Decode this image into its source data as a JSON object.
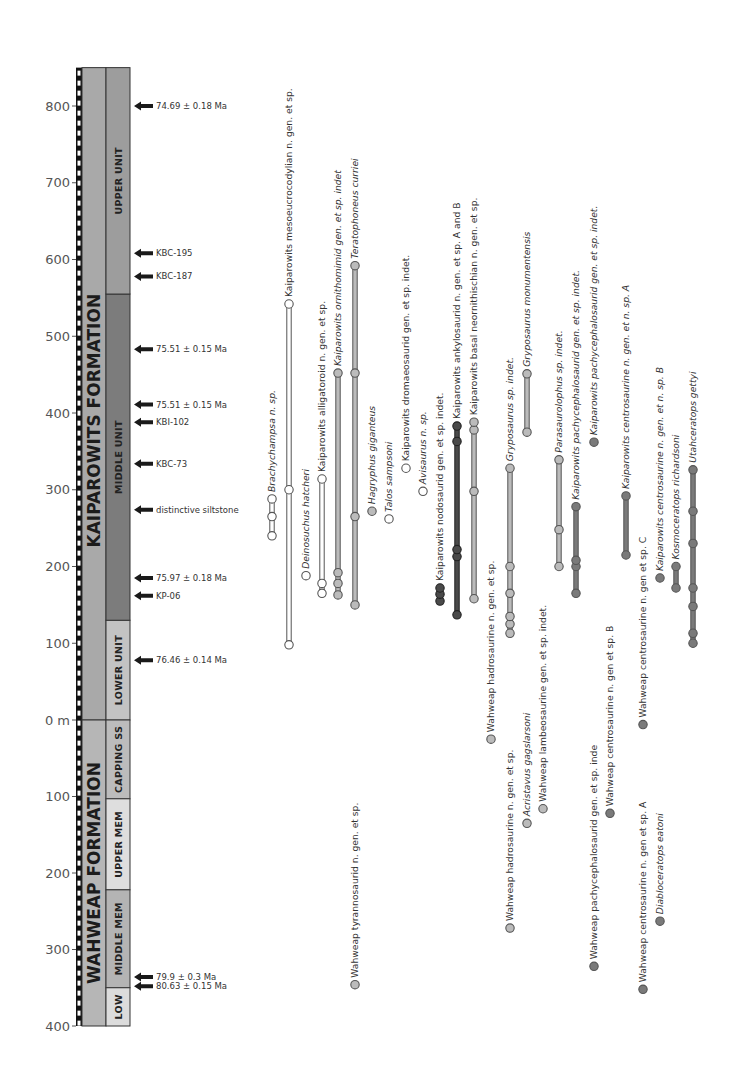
{
  "chart_data": {
    "type": "range-chart",
    "title": "",
    "ylabel": "Stratigraphic height (m)",
    "grid": false,
    "axis": {
      "kaiparowits_ticks": [
        "800",
        "700",
        "600",
        "500",
        "400",
        "300",
        "200",
        "100"
      ],
      "zero_label": "0 m",
      "wahweap_ticks": [
        "100",
        "200",
        "300",
        "400"
      ],
      "kaiparowits_range": [
        0,
        850
      ],
      "wahweap_range": [
        0,
        400
      ]
    },
    "formations": [
      {
        "name": "KAIPAROWITS FORMATION",
        "base": 0,
        "top": 850,
        "color": "#a9a9a9",
        "units": [
          {
            "name": "LOWER UNIT",
            "from": 0,
            "to": 130,
            "color": "#c3c3c3"
          },
          {
            "name": "MIDDLE UNIT",
            "from": 130,
            "to": 555,
            "color": "#7c7c7c"
          },
          {
            "name": "UPPER UNIT",
            "from": 555,
            "to": 850,
            "color": "#9d9d9d"
          }
        ]
      },
      {
        "name": "WAHWEAP FORMATION",
        "base": 400,
        "top": 0,
        "color": "#b6b6b6",
        "units": [
          {
            "name": "CAPPING SS",
            "from": 0,
            "to": 103,
            "color": "#bcbcbc"
          },
          {
            "name": "UPPER MEM",
            "from": 103,
            "to": 222,
            "color": "#dedede"
          },
          {
            "name": "MIDDLE MEM",
            "from": 222,
            "to": 350,
            "color": "#b4b4b4"
          },
          {
            "name": "LOW",
            "from": 350,
            "to": 400,
            "color": "#dcdcdc"
          }
        ]
      }
    ],
    "markers": [
      {
        "label": "74.69 ± 0.18 Ma",
        "formation": "K",
        "height": 800
      },
      {
        "label": "KBC-195",
        "formation": "K",
        "height": 608
      },
      {
        "label": "KBC-187",
        "formation": "K",
        "height": 578
      },
      {
        "label": "75.51 ± 0.15 Ma",
        "formation": "K",
        "height": 483
      },
      {
        "label": "75.51 ± 0.15 Ma",
        "formation": "K",
        "height": 411
      },
      {
        "label": "KBI-102",
        "formation": "K",
        "height": 388
      },
      {
        "label": "KBC-73",
        "formation": "K",
        "height": 334
      },
      {
        "label": "distinctive siltstone",
        "formation": "K",
        "height": 274
      },
      {
        "label": "75.97 ± 0.18 Ma",
        "formation": "K",
        "height": 185
      },
      {
        "label": "KP-06",
        "formation": "K",
        "height": 162
      },
      {
        "label": "76.46 ± 0.14 Ma",
        "formation": "K",
        "height": 78
      },
      {
        "label": "79.9 ± 0.3 Ma",
        "formation": "W",
        "depth": 336
      },
      {
        "label": "80.63 ± 0.15 Ma",
        "formation": "W",
        "depth": 348
      }
    ],
    "taxa": [
      {
        "name": "Brachychampsa n. sp.",
        "italic": true,
        "group": "croc",
        "fill": "#ffffff",
        "x": 272,
        "occurrences": [
          240,
          265,
          288
        ]
      },
      {
        "name": "Kaiparowits mesoeucrocodylian n. gen. et sp.",
        "italic": false,
        "group": "croc",
        "fill": "#ffffff",
        "x": 289,
        "occurrences": [
          98,
          300,
          542
        ]
      },
      {
        "name": "Deinosuchus hatcheri",
        "italic": true,
        "group": "croc",
        "fill": "#ffffff",
        "x": 306,
        "occurrences": [
          188
        ]
      },
      {
        "name": "Kaiparowits alligatoroid n. gen. et sp.",
        "italic": false,
        "group": "croc",
        "fill": "#ffffff",
        "x": 322,
        "occurrences": [
          165,
          178,
          314
        ]
      },
      {
        "name": "Kaiparowits ornithomimid gen. et sp. indet",
        "italic": true,
        "group": "theropod",
        "fill": "#bbbbbb",
        "x": 338,
        "occurrences": [
          163,
          178,
          192,
          452
        ]
      },
      {
        "name": "Teratophoneus curriei",
        "italic": true,
        "group": "theropod",
        "fill": "#bbbbbb",
        "x": 355,
        "occurrences": [
          150,
          265,
          452,
          592
        ]
      },
      {
        "name": "Hagryphus giganteus",
        "italic": true,
        "group": "theropod",
        "fill": "#bbbbbb",
        "x": 372,
        "occurrences": [
          272
        ]
      },
      {
        "name": "Talos sampsoni",
        "italic": true,
        "group": "theropod",
        "fill": "#ffffff",
        "x": 389,
        "occurrences": [
          262
        ]
      },
      {
        "name": "Kaiparowits dromaeosaurid gen. et sp. indet.",
        "italic": false,
        "group": "theropod",
        "fill": "#ffffff",
        "x": 406,
        "occurrences": [
          328
        ]
      },
      {
        "name": "Avisaurus n. sp.",
        "italic": true,
        "group": "theropod",
        "fill": "#ffffff",
        "x": 423,
        "occurrences": [
          298
        ]
      },
      {
        "name": "Kaiparowits nodosaurid gen. et sp. indet.",
        "italic": false,
        "group": "ankylosaur",
        "fill": "#4a4a4a",
        "x": 440,
        "occurrences": [
          155,
          164,
          172
        ]
      },
      {
        "name": "Kaiparowits ankylosaurid n. gen. et sp. A and B",
        "italic": false,
        "group": "ankylosaur",
        "fill": "#4a4a4a",
        "x": 457,
        "occurrences": [
          137,
          213,
          222,
          363,
          383
        ]
      },
      {
        "name": "Kaiparowits basal neornithischian n. gen. et sp.",
        "italic": false,
        "group": "ornithopod",
        "fill": "#bbbbbb",
        "x": 474,
        "occurrences": [
          158,
          298,
          378,
          388
        ]
      },
      {
        "name": "Wahweap hadrosaurine n. gen. et sp.",
        "italic": false,
        "group": "hadrosaur",
        "fill": "#bbbbbb",
        "x": 491,
        "formation": "W",
        "occurrences": [
          25
        ]
      },
      {
        "name": "Gryposaurus sp. indet.",
        "italic": true,
        "group": "hadrosaur",
        "fill": "#bbbbbb",
        "x": 510,
        "occurrences": [
          113,
          125,
          135,
          165,
          200,
          328
        ]
      },
      {
        "name": "Gryposaurus monumentensis",
        "italic": true,
        "group": "hadrosaur",
        "fill": "#bbbbbb",
        "x": 527,
        "occurrences": [
          375,
          451
        ]
      },
      {
        "name": "Wahweap hadrosaurine n. gen. et sp.",
        "italic": false,
        "group": "hadrosaur",
        "fill": "#bbbbbb",
        "x": 510,
        "formation": "W",
        "occurrences": [
          272
        ]
      },
      {
        "name": "Acristavus gagslarsoni",
        "italic": true,
        "group": "hadrosaur",
        "fill": "#bbbbbb",
        "x": 527,
        "formation": "W",
        "occurrences": [
          135
        ]
      },
      {
        "name": "Wahweap lambeosaurine gen. et sp. indet.",
        "italic": false,
        "group": "hadrosaur",
        "fill": "#bbbbbb",
        "x": 543,
        "formation": "W",
        "occurrences": [
          116
        ]
      },
      {
        "name": "Parasaurolophus sp. indet.",
        "italic": true,
        "group": "hadrosaur",
        "fill": "#bbbbbb",
        "x": 559,
        "occurrences": [
          200,
          248,
          339
        ]
      },
      {
        "name": "Kaiparowits pachycephalosaurid gen. et sp. indet.",
        "italic": true,
        "group": "pachy",
        "fill": "#7a7a7a",
        "x": 576,
        "occurrences": [
          165,
          200,
          208,
          278
        ]
      },
      {
        "name": "Kaiparowits pachycephalosaurid gen. et sp. indet.",
        "italic": true,
        "group": "pachy",
        "fill": "#7a7a7a",
        "x": 594,
        "occurrences": [
          362
        ]
      },
      {
        "name": "Wahweap pachycephalosaurid gen. et sp. inde",
        "italic": false,
        "group": "pachy",
        "fill": "#7a7a7a",
        "x": 594,
        "formation": "W",
        "occurrences": [
          322
        ]
      },
      {
        "name": "Wahweap centrosaurine n. gen et sp. B",
        "italic": false,
        "group": "ceratopsian",
        "fill": "#7a7a7a",
        "x": 610,
        "formation": "W",
        "occurrences": [
          122
        ]
      },
      {
        "name": "Kaiparowits centrosaurine n. gen. et n. sp. A",
        "italic": true,
        "group": "ceratopsian",
        "fill": "#7a7a7a",
        "x": 626,
        "occurrences": [
          215,
          292
        ]
      },
      {
        "name": "Wahweap centrosaurine n. gen et sp. C",
        "italic": false,
        "group": "ceratopsian",
        "fill": "#7a7a7a",
        "x": 643,
        "formation": "W",
        "occurrences": [
          6
        ]
      },
      {
        "name": "Kaiparowits centrosaurine n. gen. et n. sp. B",
        "italic": true,
        "group": "ceratopsian",
        "fill": "#7a7a7a",
        "x": 660,
        "occurrences": [
          185
        ]
      },
      {
        "name": "Kosmoceratops richardsoni",
        "italic": true,
        "group": "ceratopsian",
        "fill": "#7a7a7a",
        "x": 676,
        "occurrences": [
          172,
          200
        ]
      },
      {
        "name": "Utahceratops gettyi",
        "italic": true,
        "group": "ceratopsian",
        "fill": "#7a7a7a",
        "x": 693,
        "occurrences": [
          100,
          113,
          148,
          172,
          230,
          272,
          326
        ]
      },
      {
        "name": "Wahweap centrosaurine n. gen et sp. A",
        "italic": false,
        "group": "ceratopsian",
        "fill": "#7a7a7a",
        "x": 643,
        "formation": "W",
        "occurrences": [
          352
        ]
      },
      {
        "name": "Diabloceratops eatoni",
        "italic": true,
        "group": "ceratopsian",
        "fill": "#7a7a7a",
        "x": 660,
        "formation": "W",
        "occurrences": [
          263
        ]
      },
      {
        "name": "Wahweap tyrannosaurid n. gen. et sp.",
        "italic": false,
        "group": "theropod",
        "fill": "#bbbbbb",
        "x": 355,
        "formation": "W",
        "occurrences": [
          346
        ]
      }
    ]
  }
}
